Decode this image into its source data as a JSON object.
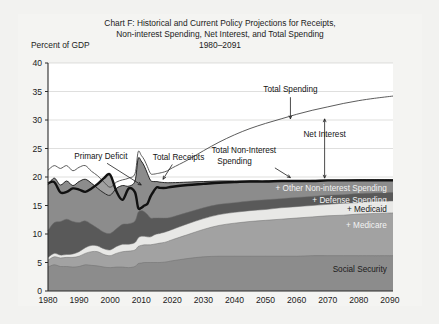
{
  "chart_data": {
    "type": "area",
    "title": "Chart F: Historical and Current Policy Projections for Receipts,",
    "title_line2": "Non-interest Spending, Net Interest, and Total Spending",
    "subtitle": "1980–2091",
    "ylabel": "Percent of GDP",
    "xlabel": "",
    "xlim": [
      1980,
      2091
    ],
    "ylim": [
      0,
      40
    ],
    "yticks": [
      0,
      5,
      10,
      15,
      20,
      25,
      30,
      35,
      40
    ],
    "xticks": [
      1980,
      1990,
      2000,
      2010,
      2020,
      2030,
      2040,
      2050,
      2060,
      2070,
      2080,
      2090
    ],
    "grid": true,
    "legend_position": "inline-labels",
    "colors": {
      "social_security": "#8c8c8c",
      "medicare": "#a2a2a2",
      "medicaid": "#e8e8e6",
      "defense": "#595959",
      "other_noninterest": "#8c8c8c",
      "total_receipts_line": "#111111",
      "total_noninterest_line": "#111111",
      "total_spending_line": "#4a4a4a",
      "primary_deficit_fill": "#9b9b9b",
      "plot_background": "#ffffff",
      "page_background": "#f2f2f0"
    },
    "x": [
      1980,
      1982,
      1984,
      1986,
      1988,
      1990,
      1992,
      1994,
      1996,
      1998,
      2000,
      2002,
      2004,
      2006,
      2008,
      2009,
      2010,
      2011,
      2012,
      2013,
      2014,
      2015,
      2016,
      2018,
      2020,
      2025,
      2030,
      2035,
      2040,
      2045,
      2050,
      2055,
      2060,
      2065,
      2070,
      2075,
      2080,
      2085,
      2091
    ],
    "series": [
      {
        "name": "Social Security",
        "label": "Social Security",
        "values": [
          4.2,
          4.6,
          4.3,
          4.3,
          4.2,
          4.3,
          4.6,
          4.5,
          4.4,
          4.2,
          4.1,
          4.2,
          4.2,
          4.1,
          4.3,
          4.8,
          4.9,
          5.0,
          5.0,
          5.0,
          5.0,
          5.0,
          5.0,
          5.1,
          5.3,
          5.7,
          6.0,
          6.1,
          6.1,
          6.1,
          6.1,
          6.1,
          6.1,
          6.2,
          6.2,
          6.2,
          6.2,
          6.2,
          6.2
        ]
      },
      {
        "name": "+ Medicare",
        "label": "+ Medicare",
        "values": [
          5.4,
          6.0,
          5.8,
          5.9,
          5.9,
          6.1,
          6.6,
          6.9,
          6.9,
          6.4,
          6.2,
          6.6,
          6.9,
          7.0,
          7.2,
          7.8,
          8.0,
          8.1,
          8.1,
          8.1,
          8.2,
          8.3,
          8.4,
          8.6,
          9.0,
          9.9,
          10.8,
          11.5,
          11.9,
          12.2,
          12.4,
          12.6,
          12.8,
          13.0,
          13.2,
          13.3,
          13.5,
          13.6,
          13.7
        ]
      },
      {
        "name": "+ Medicaid",
        "label": "+ Medicaid",
        "values": [
          5.9,
          6.6,
          6.3,
          6.4,
          6.5,
          6.9,
          7.6,
          8.0,
          7.9,
          7.4,
          7.2,
          7.8,
          8.2,
          8.2,
          8.5,
          9.3,
          9.6,
          9.6,
          9.5,
          9.5,
          9.8,
          10.0,
          10.1,
          10.4,
          10.8,
          11.8,
          12.7,
          13.4,
          13.8,
          14.1,
          14.3,
          14.6,
          14.8,
          15.0,
          15.2,
          15.4,
          15.5,
          15.7,
          15.8
        ]
      },
      {
        "name": "+ Defense Spending",
        "label": "+ Defense Spending",
        "values": [
          10.6,
          12.0,
          12.2,
          12.6,
          12.2,
          12.0,
          12.3,
          11.7,
          11.0,
          10.3,
          10.1,
          10.9,
          11.7,
          11.8,
          12.3,
          13.8,
          14.1,
          13.9,
          13.4,
          12.8,
          12.8,
          12.8,
          12.8,
          12.8,
          13.0,
          13.8,
          14.6,
          15.2,
          15.5,
          15.8,
          16.0,
          16.2,
          16.4,
          16.6,
          16.8,
          16.9,
          17.1,
          17.2,
          17.3
        ]
      },
      {
        "name": "+ Other Non-interest Spending",
        "label": "+ Other Non-interest Spending",
        "values": [
          18.6,
          19.8,
          18.6,
          19.3,
          18.5,
          19.2,
          19.6,
          18.9,
          18.0,
          17.2,
          16.8,
          18.0,
          18.5,
          18.4,
          19.3,
          23.2,
          22.8,
          21.9,
          20.6,
          19.4,
          19.2,
          19.2,
          19.1,
          19.0,
          19.0,
          19.1,
          19.2,
          19.3,
          19.3,
          19.3,
          19.3,
          19.3,
          19.3,
          19.4,
          19.4,
          19.4,
          19.5,
          19.5,
          19.5
        ]
      }
    ],
    "lines": [
      {
        "name": "Total Receipts",
        "label": "Total Receipts",
        "style": "thick-black",
        "values": [
          18.9,
          19.1,
          17.3,
          17.4,
          18.0,
          17.8,
          17.4,
          18.0,
          18.8,
          19.8,
          20.4,
          17.5,
          16.0,
          18.0,
          17.3,
          14.6,
          14.6,
          15.0,
          15.3,
          16.6,
          17.5,
          18.2,
          18.1,
          18.1,
          18.3,
          18.6,
          18.8,
          19.0,
          19.1,
          19.2,
          19.2,
          19.3,
          19.3,
          19.3,
          19.4,
          19.4,
          19.4,
          19.4,
          19.4
        ]
      },
      {
        "name": "Total Non-Interest Spending",
        "label": "Total Non-Interest Spending",
        "style": "matches-stack-top",
        "values": [
          18.6,
          19.8,
          18.6,
          19.3,
          18.5,
          19.2,
          19.6,
          18.9,
          18.0,
          17.2,
          16.8,
          18.0,
          18.5,
          18.4,
          19.3,
          23.2,
          22.8,
          21.9,
          20.6,
          19.4,
          19.2,
          19.2,
          19.1,
          19.0,
          19.0,
          19.1,
          19.2,
          19.3,
          19.3,
          19.3,
          19.3,
          19.3,
          19.3,
          19.4,
          19.4,
          19.4,
          19.5,
          19.5,
          19.5
        ]
      },
      {
        "name": "Total Spending",
        "label": "Total Spending",
        "style": "thin-gray",
        "values": [
          21.2,
          22.0,
          21.5,
          22.0,
          21.1,
          21.7,
          22.0,
          21.0,
          20.2,
          19.1,
          18.2,
          19.1,
          19.5,
          19.8,
          20.6,
          24.4,
          23.8,
          23.0,
          21.8,
          20.6,
          20.5,
          20.6,
          20.7,
          21.0,
          21.6,
          23.0,
          24.6,
          26.1,
          27.4,
          28.5,
          29.4,
          30.2,
          31.0,
          31.7,
          32.3,
          32.9,
          33.4,
          33.8,
          34.2
        ]
      }
    ],
    "annotations": [
      {
        "text": "Total Spending",
        "value_at_2062": 30.5
      },
      {
        "text": "Net Interest",
        "description": "gap between Total Spending and Total Non-Interest Spending"
      },
      {
        "text": "Total Non-Interest Spending",
        "value_at_2090": 19.5
      },
      {
        "text": "Total Receipts",
        "value_at_2090": 19.4
      },
      {
        "text": "Primary Deficit",
        "description": "gap between Total Non-Interest Spending and Total Receipts"
      }
    ]
  },
  "annotations": {
    "total_spending": "Total Spending",
    "net_interest": "Net Interest",
    "total_noninterest_1": "Total Non-Interest",
    "total_noninterest_2": "Spending",
    "total_receipts": "Total Receipts",
    "primary_deficit": "Primary Deficit"
  },
  "stack_labels": {
    "social_security": "Social Security",
    "medicare": "+ Medicare",
    "medicaid": "+ Medicaid",
    "defense": "+ Defense Spending",
    "other": "+ Other Non-interest Spending"
  }
}
